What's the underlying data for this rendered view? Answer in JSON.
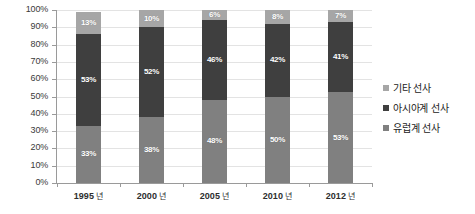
{
  "chart_data": {
    "type": "bar",
    "subtype": "100% stacked column",
    "title": "",
    "xlabel": "",
    "ylabel": "",
    "ylim": [
      0,
      100
    ],
    "grid": true,
    "legend_position": "right",
    "categories": [
      "1995 년",
      "2000 년",
      "2005 년",
      "2010 년",
      "2012 년"
    ],
    "y_ticks": [
      "0%",
      "10%",
      "20%",
      "30%",
      "40%",
      "50%",
      "60%",
      "70%",
      "80%",
      "90%",
      "100%"
    ],
    "series": [
      {
        "name": "유럽계 선사",
        "color": "#808080",
        "stack_order": 0,
        "values": [
          33,
          38,
          48,
          50,
          53
        ],
        "labels": [
          "33%",
          "38%",
          "48%",
          "50%",
          "53%"
        ]
      },
      {
        "name": "아시아계 선사",
        "color": "#3f3f3f",
        "stack_order": 1,
        "values": [
          53,
          52,
          46,
          42,
          41
        ],
        "labels": [
          "53%",
          "52%",
          "46%",
          "42%",
          "41%"
        ]
      },
      {
        "name": "기타 선사",
        "color": "#a6a6a6",
        "stack_order": 2,
        "values": [
          13,
          10,
          6,
          8,
          7
        ],
        "labels": [
          "13%",
          "10%",
          "6%",
          "8%",
          "7%"
        ]
      }
    ]
  },
  "axis": {
    "y_labels": [
      "100%",
      "90%",
      "80%",
      "70%",
      "60%",
      "50%",
      "40%",
      "30%",
      "20%",
      "10%",
      "0%"
    ],
    "x_labels": [
      {
        "year": "1995",
        "suffix": "년"
      },
      {
        "year": "2000",
        "suffix": "년"
      },
      {
        "year": "2005",
        "suffix": "년"
      },
      {
        "year": "2010",
        "suffix": "년"
      },
      {
        "year": "2012",
        "suffix": "년"
      }
    ]
  },
  "legend": {
    "items": [
      {
        "label": "기타 선사",
        "key": "other"
      },
      {
        "label": "아시아계 선사",
        "key": "asia"
      },
      {
        "label": "유럽계 선사",
        "key": "europe"
      }
    ]
  },
  "colors": {
    "other": "#a6a6a6",
    "asia": "#3f3f3f",
    "europe": "#808080",
    "axis": "#9a9a9a",
    "grid": "#e3e3e3",
    "label_text": "#ffffff",
    "background": "#ffffff"
  }
}
